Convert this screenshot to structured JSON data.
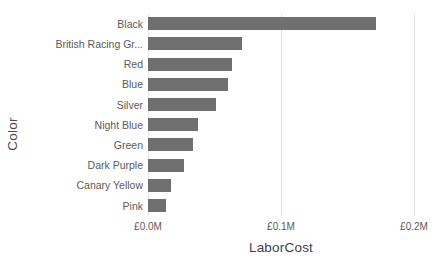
{
  "chart_data": {
    "type": "bar",
    "orientation": "horizontal",
    "title": "",
    "xlabel": "LaborCost",
    "ylabel": "Color",
    "categories": [
      "Black",
      "British Racing Gr...",
      "Red",
      "Blue",
      "Silver",
      "Night Blue",
      "Green",
      "Dark Purple",
      "Canary Yellow",
      "Pink"
    ],
    "values": [
      0.1714,
      0.0707,
      0.0632,
      0.0602,
      0.0511,
      0.0376,
      0.0338,
      0.0271,
      0.0173,
      0.0135
    ],
    "value_unit": "£M",
    "xlim": [
      0,
      0.2
    ],
    "xticks": [
      0,
      0.1,
      0.2
    ],
    "xtick_labels": [
      "£0.0M",
      "£0.1M",
      "£0.2M"
    ],
    "grid": true,
    "grid_axis": "x",
    "legend": false,
    "bar_color": "#706f6f",
    "gridline_color": "#e2e2e2",
    "background": "#ffffff"
  }
}
